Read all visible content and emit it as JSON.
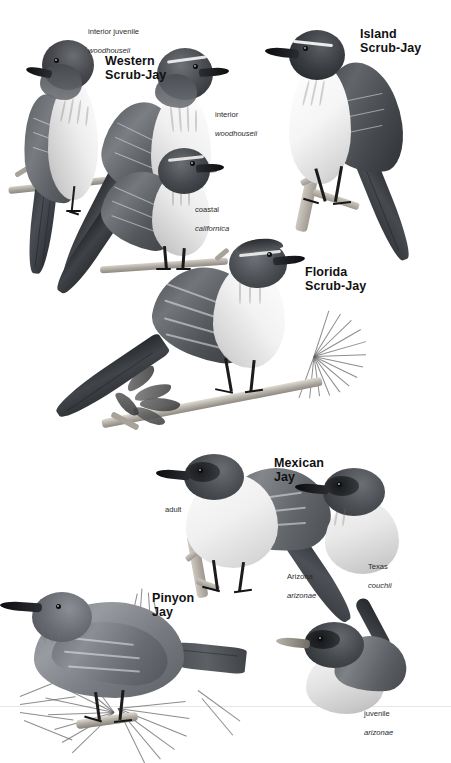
{
  "plate": {
    "kind": "field-guide-illustration-plate",
    "subject": "Jays (Aphelocoma and Gymnorhinus)",
    "rendering": "grayscale painted plate",
    "background_color": "#ffffff",
    "ink_color": "#111111"
  },
  "species": [
    {
      "id": "western-scrub-jay",
      "title": "Western\nScrub-Jay",
      "title_pos": {
        "x": 105,
        "y": 55
      },
      "annotations": [
        {
          "id": "interior-juvenile-woodhouseii",
          "plain": "interior juvenile",
          "scientific": "woodhouseii",
          "x": 88,
          "y": 18
        },
        {
          "id": "interior-woodhouseii",
          "plain": "interior",
          "scientific": "woodhouseii",
          "x": 215,
          "y": 101
        },
        {
          "id": "coastal-californica",
          "plain": "coastal",
          "scientific": "californica",
          "x": 195,
          "y": 196
        }
      ]
    },
    {
      "id": "island-scrub-jay",
      "title": "Island\nScrub-Jay",
      "title_pos": {
        "x": 360,
        "y": 28
      },
      "annotations": []
    },
    {
      "id": "florida-scrub-jay",
      "title": "Florida\nScrub-Jay",
      "title_pos": {
        "x": 305,
        "y": 266
      },
      "annotations": []
    },
    {
      "id": "mexican-jay",
      "title": "Mexican\nJay",
      "title_pos": {
        "x": 274,
        "y": 457
      },
      "annotations": [
        {
          "id": "adult",
          "plain": "adult",
          "scientific": "",
          "x": 165,
          "y": 496
        },
        {
          "id": "arizona-arizonae",
          "plain": "Arizona",
          "scientific": "arizonae",
          "x": 287,
          "y": 563
        },
        {
          "id": "texas-couchii",
          "plain": "Texas",
          "scientific": "couchii",
          "x": 368,
          "y": 553
        },
        {
          "id": "juvenile-arizonae",
          "plain": "juvenile",
          "scientific": "arizonae",
          "x": 364,
          "y": 700
        }
      ]
    },
    {
      "id": "pinyon-jay",
      "title": "Pinyon\nJay",
      "title_pos": {
        "x": 152,
        "y": 592
      },
      "annotations": []
    }
  ],
  "figures": [
    {
      "id": "western-juvenile-woodhouseii",
      "species": "western-scrub-jay",
      "pose": "perched, back view, head turned left",
      "note": "interior juvenile woodhouseii"
    },
    {
      "id": "western-adult-woodhouseii",
      "species": "western-scrub-jay",
      "pose": "perched, facing right",
      "note": "interior woodhouseii"
    },
    {
      "id": "western-adult-californica",
      "species": "western-scrub-jay",
      "pose": "perched, facing right, long tail down",
      "note": "coastal californica"
    },
    {
      "id": "island-adult",
      "species": "island-scrub-jay",
      "pose": "perched on lichen twig, facing left"
    },
    {
      "id": "florida-adult",
      "species": "florida-scrub-jay",
      "pose": "perched on oak/pine branch, facing right"
    },
    {
      "id": "mexican-adult-arizonae",
      "species": "mexican-jay",
      "pose": "perched on branch, facing left"
    },
    {
      "id": "mexican-head-couchii",
      "species": "mexican-jay",
      "pose": "head and breast only, facing left"
    },
    {
      "id": "mexican-juvenile-arizonae",
      "species": "mexican-jay",
      "pose": "head and breast only, facing left"
    },
    {
      "id": "pinyon-adult",
      "species": "pinyon-jay",
      "pose": "perched on pine branch among needles, facing left"
    }
  ]
}
